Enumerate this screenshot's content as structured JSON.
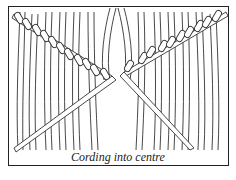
{
  "figure": {
    "caption": "Cording into centre",
    "line_color": "#222222"
  }
}
